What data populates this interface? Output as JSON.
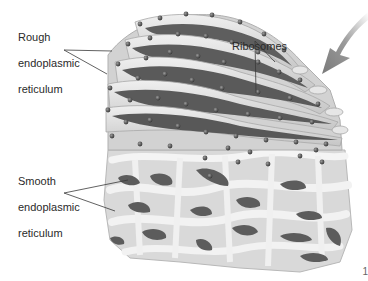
{
  "figure": {
    "subject": "Endoplasmic reticulum",
    "colors": {
      "background": "#ffffff",
      "membrane_light": "#e4e4e4",
      "membrane_mid": "#c4c4c4",
      "lumen_dark": "#5e5e5e",
      "ribosome": "#4a4a4a",
      "leader_line": "#3a3a3a",
      "arrow": "#8a8a8a",
      "text": "#2a2a2a"
    }
  },
  "labels": {
    "rough_er": {
      "line1": "Rough",
      "line2": "endoplasmic",
      "line3": "reticulum"
    },
    "smooth_er": {
      "line1": "Smooth",
      "line2": "endoplasmic",
      "line3": "reticulum"
    },
    "ribosomes": "Ribosomes"
  },
  "icons": {
    "direction_arrow": "arrow-down-left-icon"
  },
  "page_fragment": "1"
}
